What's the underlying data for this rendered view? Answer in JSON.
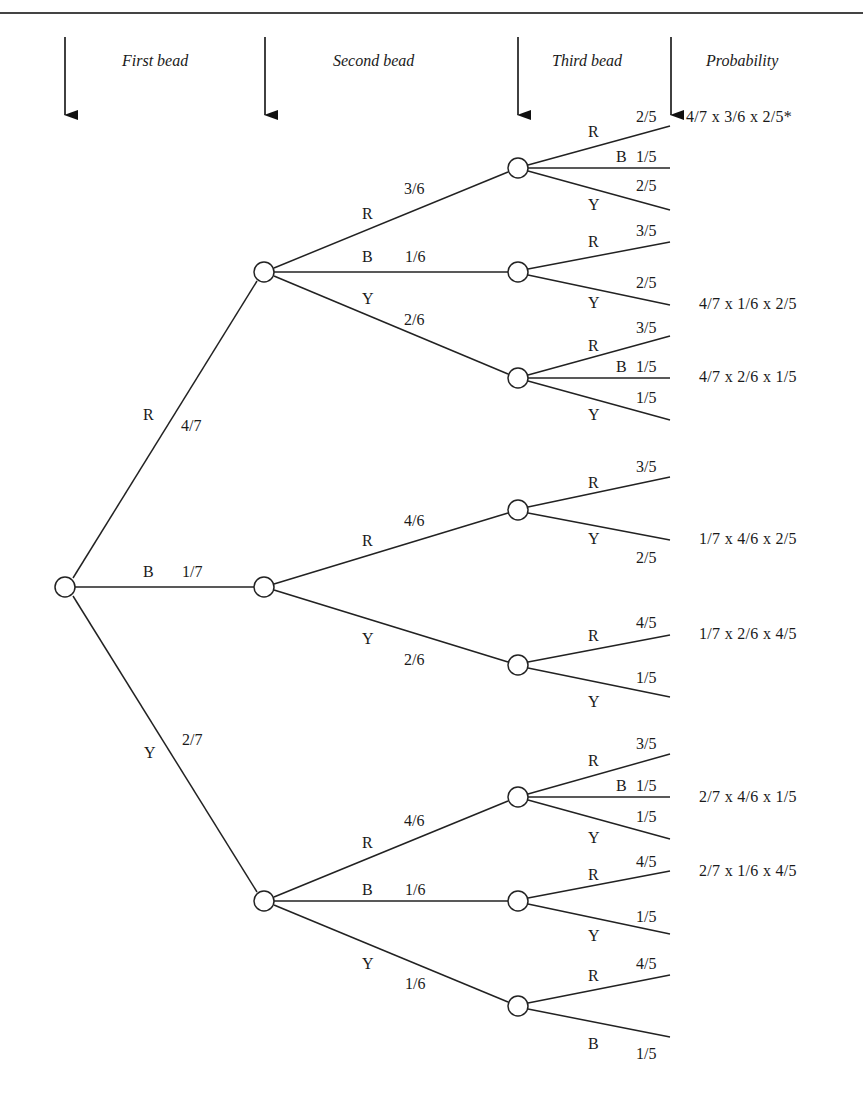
{
  "headers": {
    "first": "First bead",
    "second": "Second bead",
    "third": "Third bead",
    "probability": "Probability"
  },
  "colors": {
    "line": "#222222",
    "text": "#1a1a1a",
    "background": "#ffffff"
  },
  "level1": [
    {
      "color": "R",
      "prob": "4/7"
    },
    {
      "color": "B",
      "prob": "1/7"
    },
    {
      "color": "Y",
      "prob": "2/7"
    }
  ],
  "level2": [
    {
      "parent": "R",
      "color": "R",
      "prob": "3/6"
    },
    {
      "parent": "R",
      "color": "B",
      "prob": "1/6"
    },
    {
      "parent": "R",
      "color": "Y",
      "prob": "2/6"
    },
    {
      "parent": "B",
      "color": "R",
      "prob": "4/6"
    },
    {
      "parent": "B",
      "color": "Y",
      "prob": "2/6"
    },
    {
      "parent": "Y",
      "color": "R",
      "prob": "4/6"
    },
    {
      "parent": "Y",
      "color": "B",
      "prob": "1/6"
    },
    {
      "parent": "Y",
      "color": "Y",
      "prob": "1/6"
    }
  ],
  "level3": [
    {
      "path": "RR",
      "color": "R",
      "prob": "2/5"
    },
    {
      "path": "RR",
      "color": "B",
      "prob": "1/5"
    },
    {
      "path": "RR",
      "color": "Y",
      "prob": "2/5"
    },
    {
      "path": "RB",
      "color": "R",
      "prob": "3/5"
    },
    {
      "path": "RB",
      "color": "Y",
      "prob": "2/5"
    },
    {
      "path": "RY",
      "color": "R",
      "prob": "3/5"
    },
    {
      "path": "RY",
      "color": "B",
      "prob": "1/5"
    },
    {
      "path": "RY",
      "color": "Y",
      "prob": "1/5"
    },
    {
      "path": "BR",
      "color": "R",
      "prob": "3/5"
    },
    {
      "path": "BR",
      "color": "Y",
      "prob": "2/5"
    },
    {
      "path": "BY",
      "color": "R",
      "prob": "4/5"
    },
    {
      "path": "BY",
      "color": "Y",
      "prob": "1/5"
    },
    {
      "path": "YR",
      "color": "R",
      "prob": "3/5"
    },
    {
      "path": "YR",
      "color": "B",
      "prob": "1/5"
    },
    {
      "path": "YR",
      "color": "Y",
      "prob": "1/5"
    },
    {
      "path": "YB",
      "color": "R",
      "prob": "4/5"
    },
    {
      "path": "YB",
      "color": "Y",
      "prob": "1/5"
    },
    {
      "path": "YY",
      "color": "R",
      "prob": "4/5"
    },
    {
      "path": "YY",
      "color": "B",
      "prob": "1/5"
    }
  ],
  "probabilities": [
    "4/7 x 3/6 x 2/5*",
    "4/7 x 1/6 x 2/5",
    "4/7 x 2/6 x 1/5",
    "1/7 x 4/6 x 2/5",
    "1/7 x 2/6 x 4/5",
    "2/7 x 4/6 x 1/5",
    "2/7 x 1/6 x 4/5"
  ]
}
